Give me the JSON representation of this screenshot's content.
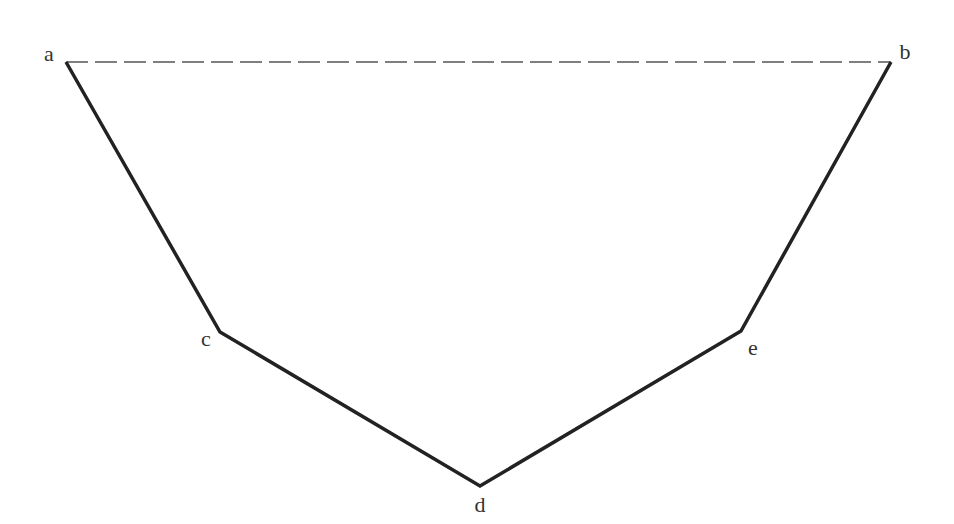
{
  "diagram": {
    "colors": {
      "stroke": "#222222",
      "dashed": "#555555",
      "label": "#333333",
      "background": "#ffffff"
    },
    "points": {
      "a": {
        "label": "a",
        "x": 66,
        "y": 62,
        "lx": 49,
        "ly": 61
      },
      "b": {
        "label": "b",
        "x": 891,
        "y": 62,
        "lx": 905,
        "ly": 59
      },
      "c": {
        "label": "c",
        "x": 220,
        "y": 332,
        "lx": 206,
        "ly": 346
      },
      "d": {
        "label": "d",
        "x": 480,
        "y": 486,
        "lx": 480,
        "ly": 512
      },
      "e": {
        "label": "e",
        "x": 741,
        "y": 331,
        "lx": 753,
        "ly": 355
      }
    },
    "segments": [
      {
        "from": "a",
        "to": "c",
        "style": "solid"
      },
      {
        "from": "c",
        "to": "d",
        "style": "solid"
      },
      {
        "from": "d",
        "to": "e",
        "style": "solid"
      },
      {
        "from": "e",
        "to": "b",
        "style": "solid"
      },
      {
        "from": "a",
        "to": "b",
        "style": "dashed"
      }
    ]
  }
}
